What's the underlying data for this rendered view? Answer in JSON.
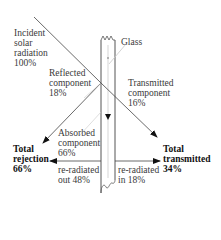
{
  "diagram": {
    "labels": {
      "incident": [
        "Incident",
        "solar",
        "radiation",
        "100%"
      ],
      "glass": "Glass",
      "reflected": [
        "Reflected",
        "component",
        "18%"
      ],
      "transmitted": [
        "Transmitted",
        "component",
        "16%"
      ],
      "absorbed": [
        "Absorbed",
        "component",
        "66%"
      ],
      "total_rejection": [
        "Total",
        "rejection",
        "66%"
      ],
      "total_transmitted": [
        "Total",
        "transmitted",
        "34%"
      ],
      "reradiated_out": [
        "re-radiated",
        "out 48%"
      ],
      "reradiated_in": [
        "re-radiated",
        "in 18%"
      ]
    },
    "colors": {
      "line": "#444444",
      "glass_edge": "#555555",
      "leader": "#c8c8c8"
    }
  }
}
